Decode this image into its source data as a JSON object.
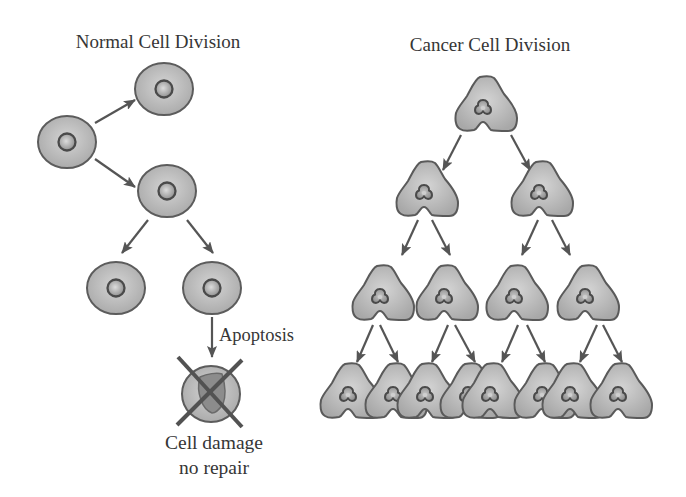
{
  "normal_division": {
    "title": "Normal Cell Division",
    "apoptosis_label": "Apoptosis",
    "outcome_label": [
      "Cell damage",
      "no repair"
    ],
    "cells": [
      {
        "id": "n1",
        "generation": 1,
        "state": "normal",
        "x": 67,
        "y": 142
      },
      {
        "id": "n2",
        "generation": 2,
        "state": "normal",
        "x": 164,
        "y": 89
      },
      {
        "id": "n3",
        "generation": 2,
        "state": "normal",
        "x": 167,
        "y": 191
      },
      {
        "id": "n4",
        "generation": 3,
        "state": "normal",
        "x": 116,
        "y": 288
      },
      {
        "id": "n5",
        "generation": 3,
        "state": "normal",
        "x": 212,
        "y": 288
      },
      {
        "id": "n6",
        "generation": 4,
        "state": "apoptotic-damaged",
        "x": 211,
        "y": 394
      }
    ],
    "arrows": [
      {
        "from": "n1",
        "to": "n2",
        "x1": 95,
        "y1": 123,
        "x2": 135,
        "y2": 100
      },
      {
        "from": "n1",
        "to": "n3",
        "x1": 95,
        "y1": 159,
        "x2": 135,
        "y2": 187
      },
      {
        "from": "n3",
        "to": "n4",
        "x1": 148,
        "y1": 220,
        "x2": 122,
        "y2": 253
      },
      {
        "from": "n3",
        "to": "n5",
        "x1": 187,
        "y1": 220,
        "x2": 213,
        "y2": 253
      },
      {
        "from": "n5",
        "to": "n6",
        "x1": 212,
        "y1": 317,
        "x2": 212,
        "y2": 357,
        "label": "Apoptosis"
      }
    ]
  },
  "cancer_division": {
    "title": "Cancer Cell Division",
    "cells_per_generation": [
      1,
      2,
      4,
      8
    ],
    "cells": [
      {
        "id": "c1",
        "generation": 1,
        "x": 486,
        "y": 104
      },
      {
        "id": "c2",
        "generation": 2,
        "x": 427,
        "y": 189
      },
      {
        "id": "c3",
        "generation": 2,
        "x": 542,
        "y": 189
      },
      {
        "id": "c4",
        "generation": 3,
        "x": 383,
        "y": 293
      },
      {
        "id": "c5",
        "generation": 3,
        "x": 447,
        "y": 293
      },
      {
        "id": "c6",
        "generation": 3,
        "x": 517,
        "y": 293
      },
      {
        "id": "c7",
        "generation": 3,
        "x": 588,
        "y": 293
      },
      {
        "id": "c8",
        "generation": 4,
        "x": 351,
        "y": 391
      },
      {
        "id": "c9",
        "generation": 4,
        "x": 396,
        "y": 391
      },
      {
        "id": "c10",
        "generation": 4,
        "x": 428,
        "y": 391
      },
      {
        "id": "c11",
        "generation": 4,
        "x": 471,
        "y": 391
      },
      {
        "id": "c12",
        "generation": 4,
        "x": 493,
        "y": 391
      },
      {
        "id": "c13",
        "generation": 4,
        "x": 545,
        "y": 391
      },
      {
        "id": "c14",
        "generation": 4,
        "x": 573,
        "y": 391
      },
      {
        "id": "c15",
        "generation": 4,
        "x": 621,
        "y": 391
      }
    ],
    "arrows": [
      {
        "from": "c1",
        "to": "c2",
        "x1": 461,
        "y1": 135,
        "x2": 443,
        "y2": 170
      },
      {
        "from": "c1",
        "to": "c3",
        "x1": 511,
        "y1": 135,
        "x2": 530,
        "y2": 170
      },
      {
        "from": "c2",
        "to": "c4",
        "x1": 418,
        "y1": 220,
        "x2": 402,
        "y2": 255
      },
      {
        "from": "c2",
        "to": "c5",
        "x1": 432,
        "y1": 220,
        "x2": 450,
        "y2": 255
      },
      {
        "from": "c3",
        "to": "c6",
        "x1": 538,
        "y1": 220,
        "x2": 522,
        "y2": 255
      },
      {
        "from": "c3",
        "to": "c7",
        "x1": 552,
        "y1": 220,
        "x2": 570,
        "y2": 255
      },
      {
        "from": "c4",
        "to": "c8",
        "x1": 373,
        "y1": 325,
        "x2": 357,
        "y2": 362
      },
      {
        "from": "c4",
        "to": "c9",
        "x1": 380,
        "y1": 325,
        "x2": 398,
        "y2": 362
      },
      {
        "from": "c5",
        "to": "c10",
        "x1": 448,
        "y1": 325,
        "x2": 432,
        "y2": 362
      },
      {
        "from": "c5",
        "to": "c11",
        "x1": 455,
        "y1": 325,
        "x2": 475,
        "y2": 362
      },
      {
        "from": "c6",
        "to": "c12",
        "x1": 518,
        "y1": 325,
        "x2": 502,
        "y2": 362
      },
      {
        "from": "c6",
        "to": "c13",
        "x1": 527,
        "y1": 325,
        "x2": 545,
        "y2": 362
      },
      {
        "from": "c7",
        "to": "c14",
        "x1": 597,
        "y1": 325,
        "x2": 580,
        "y2": 362
      },
      {
        "from": "c7",
        "to": "c15",
        "x1": 603,
        "y1": 325,
        "x2": 622,
        "y2": 362
      }
    ]
  },
  "colors": {
    "background": "#ffffff",
    "text": "#363636",
    "cell_fill_light": "#d2d2d2",
    "cell_fill_dark": "#a9a9a9",
    "cell_outline": "#5c5c5c",
    "nucleus_outline": "#4a4a4a",
    "arrow": "#555555"
  }
}
